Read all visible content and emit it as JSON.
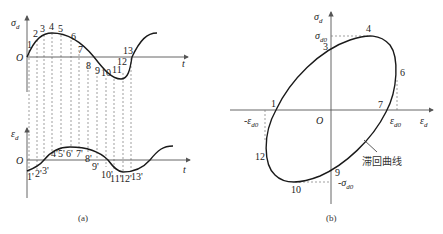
{
  "figure": {
    "panel_a": {
      "caption": "(a)",
      "top_plot": {
        "y_label": "σ",
        "y_label_sub": "d",
        "x_label": "t",
        "origin_label": "O",
        "point_labels": [
          "1",
          "2",
          "3",
          "4",
          "5",
          "6",
          "7",
          "8",
          "9",
          "10",
          "11",
          "12",
          "13"
        ]
      },
      "bottom_plot": {
        "y_label": "ε",
        "y_label_sub": "d",
        "x_label": "t",
        "origin_label": "O",
        "point_labels": [
          "1'",
          "2'",
          "3'",
          "4'",
          "5'",
          "6'",
          "7'",
          "8'",
          "9'",
          "10'",
          "11'",
          "12'",
          "13'"
        ]
      }
    },
    "panel_b": {
      "caption": "(b)",
      "y_label": "σ",
      "y_label_sub": "d",
      "x_label": "ε",
      "x_label_sub": "d",
      "origin_label": "O",
      "sigma_d0": "σ",
      "sigma_d0_sub": "d0",
      "neg_sigma_d0": "-σ",
      "neg_sigma_d0_sub": "d0",
      "eps_d0": "ε",
      "eps_d0_sub": "d0",
      "neg_eps_d0": "-ε",
      "neg_eps_d0_sub": "d0",
      "curve_label": "滞回曲线",
      "point_labels": {
        "p1": "1",
        "p3": "3",
        "p4": "4",
        "p6": "6",
        "p7": "7",
        "p9": "9",
        "p10": "10",
        "p12": "12"
      }
    }
  },
  "colors": {
    "curve": "#1a1a1a",
    "axis": "#555555",
    "dashed": "#777777"
  }
}
